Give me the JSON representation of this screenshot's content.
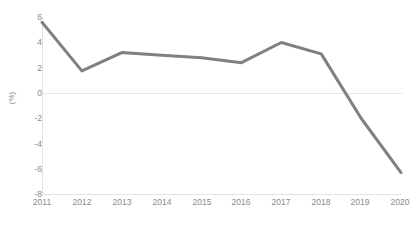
{
  "chart_data": {
    "type": "line",
    "title": "",
    "subtitle": "",
    "xlabel": "",
    "ylabel": "(%)",
    "categories": [
      "2011",
      "2012",
      "2013",
      "2014",
      "2015",
      "2016",
      "2017",
      "2018",
      "2019",
      "2020"
    ],
    "values": [
      5.6,
      1.75,
      3.2,
      3.0,
      2.8,
      2.4,
      4.0,
      3.1,
      -2.0,
      -6.3
    ],
    "series": [
      {
        "name": "",
        "values": [
          5.6,
          1.75,
          3.2,
          3.0,
          2.8,
          2.4,
          4.0,
          3.1,
          -2.0,
          -6.3
        ],
        "color": "#808080"
      }
    ],
    "ylim": [
      -8,
      6
    ],
    "ytick_values": [
      6,
      4,
      2,
      0,
      -2,
      -4,
      -6,
      -8
    ],
    "ytick_labels": [
      "6",
      "4",
      "2",
      "0",
      "-2",
      "-4",
      "-6",
      "-8"
    ],
    "grid": "zero-line-only",
    "legend": "none",
    "markers": "none",
    "line_width_px": 3,
    "colors": {
      "line": "#808080",
      "tick_text": "#8a8a8a",
      "axis": "#e2e2e2",
      "zero_gridline": "#f3e4e4",
      "background": "#ffffff",
      "caption_text": "#cfcfcf"
    }
  },
  "axes": {
    "y_label": "(%)",
    "y_ticks": [
      "6",
      "4",
      "2",
      "0",
      "-2",
      "-4",
      "-6",
      "-8"
    ],
    "x_ticks": [
      "2011",
      "2012",
      "2013",
      "2014",
      "2015",
      "2016",
      "2017",
      "2018",
      "2019",
      "2020"
    ]
  },
  "caption": {
    "text": ""
  }
}
